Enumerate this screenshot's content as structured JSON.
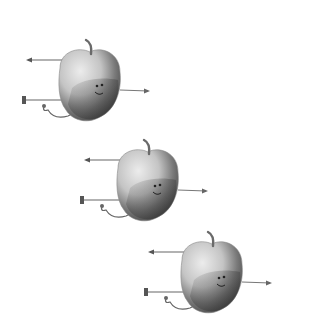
{
  "scene": {
    "description": "Three grayscale apple characters with stick arms and legs, arranged diagonally",
    "background": "#ffffff",
    "figures": [
      {
        "name": "apple-character-1",
        "x": 20,
        "y": 38
      },
      {
        "name": "apple-character-2",
        "x": 78,
        "y": 138
      },
      {
        "name": "apple-character-3",
        "x": 142,
        "y": 230
      }
    ],
    "colors": {
      "apple_light": "#d9d9d9",
      "apple_mid": "#a8a8a8",
      "apple_dark": "#555555",
      "stem": "#6a6a6a",
      "limb": "#666666"
    }
  }
}
